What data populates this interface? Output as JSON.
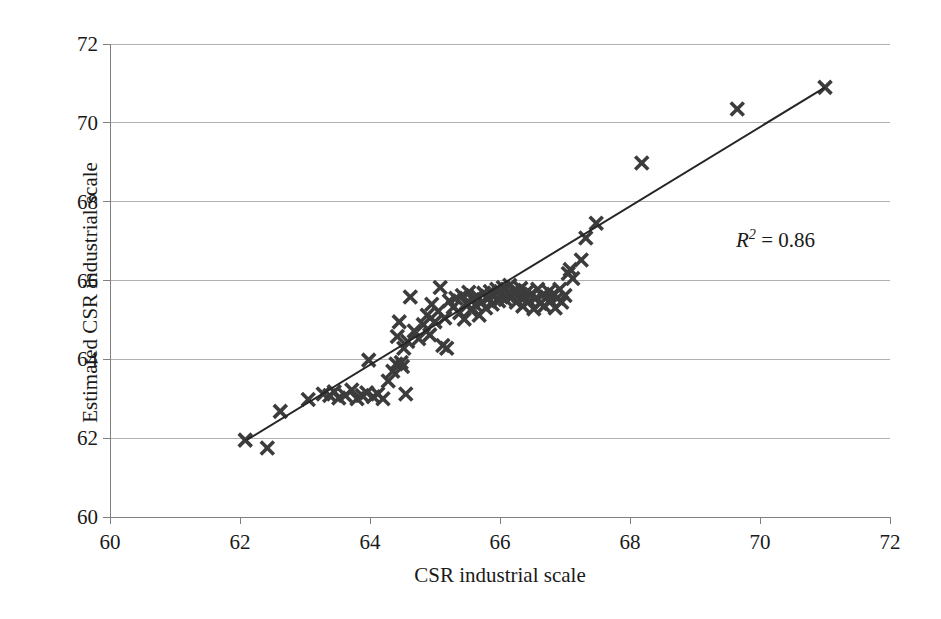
{
  "chart_data": {
    "type": "scatter",
    "title": "",
    "xlabel": "CSR industrial scale",
    "ylabel": "Estimated CSR industrial scale",
    "xlim": [
      60,
      72
    ],
    "ylim": [
      60,
      72
    ],
    "xticks": [
      60,
      62,
      64,
      66,
      68,
      70,
      72
    ],
    "yticks": [
      60,
      62,
      64,
      66,
      68,
      70,
      72
    ],
    "grid": "horizontal",
    "legend": "none",
    "annotations": [
      {
        "name": "r-squared",
        "text": "R2 = 0.86",
        "value": 0.86,
        "x": 70.6,
        "y": 67.3
      }
    ],
    "trendline": {
      "type": "linear",
      "x_start": 62.1,
      "y_start": 61.95,
      "x_end": 71.0,
      "y_end": 70.9,
      "color": "#262626"
    },
    "marker": {
      "shape": "x-bold",
      "color": "#3c3c3c",
      "size": 13
    },
    "points": [
      [
        62.08,
        61.95
      ],
      [
        62.42,
        61.75
      ],
      [
        62.62,
        62.68
      ],
      [
        63.05,
        62.98
      ],
      [
        63.28,
        63.12
      ],
      [
        63.38,
        63.08
      ],
      [
        63.45,
        63.18
      ],
      [
        63.52,
        63.02
      ],
      [
        63.62,
        63.08
      ],
      [
        63.72,
        63.22
      ],
      [
        63.8,
        63.0
      ],
      [
        63.88,
        63.08
      ],
      [
        63.95,
        63.15
      ],
      [
        63.98,
        63.98
      ],
      [
        64.05,
        63.05
      ],
      [
        64.12,
        63.12
      ],
      [
        64.2,
        63.0
      ],
      [
        64.28,
        63.45
      ],
      [
        64.35,
        63.7
      ],
      [
        64.4,
        63.88
      ],
      [
        64.42,
        64.58
      ],
      [
        64.45,
        64.95
      ],
      [
        64.48,
        63.92
      ],
      [
        64.5,
        63.82
      ],
      [
        64.52,
        64.28
      ],
      [
        64.55,
        63.12
      ],
      [
        64.58,
        64.45
      ],
      [
        64.62,
        65.58
      ],
      [
        64.68,
        64.72
      ],
      [
        64.75,
        64.52
      ],
      [
        64.82,
        64.88
      ],
      [
        64.88,
        65.12
      ],
      [
        64.92,
        64.62
      ],
      [
        64.95,
        65.4
      ],
      [
        65.0,
        64.95
      ],
      [
        65.05,
        65.22
      ],
      [
        65.08,
        65.82
      ],
      [
        65.12,
        64.35
      ],
      [
        65.15,
        65.05
      ],
      [
        65.18,
        64.28
      ],
      [
        65.22,
        65.48
      ],
      [
        65.28,
        65.32
      ],
      [
        65.32,
        65.55
      ],
      [
        65.38,
        65.18
      ],
      [
        65.42,
        65.62
      ],
      [
        65.45,
        65.02
      ],
      [
        65.48,
        65.42
      ],
      [
        65.52,
        65.7
      ],
      [
        65.55,
        65.25
      ],
      [
        65.58,
        65.52
      ],
      [
        65.62,
        65.38
      ],
      [
        65.65,
        65.6
      ],
      [
        65.68,
        65.12
      ],
      [
        65.72,
        65.45
      ],
      [
        65.75,
        65.68
      ],
      [
        65.78,
        65.3
      ],
      [
        65.82,
        65.55
      ],
      [
        65.85,
        65.72
      ],
      [
        65.88,
        65.4
      ],
      [
        65.92,
        65.62
      ],
      [
        65.95,
        65.78
      ],
      [
        65.98,
        65.48
      ],
      [
        66.02,
        65.66
      ],
      [
        66.05,
        65.82
      ],
      [
        66.08,
        65.52
      ],
      [
        66.12,
        65.7
      ],
      [
        66.15,
        65.88
      ],
      [
        66.18,
        65.58
      ],
      [
        66.22,
        65.75
      ],
      [
        66.25,
        65.45
      ],
      [
        66.28,
        65.62
      ],
      [
        66.32,
        65.8
      ],
      [
        66.35,
        65.35
      ],
      [
        66.38,
        65.58
      ],
      [
        66.42,
        65.72
      ],
      [
        66.45,
        65.48
      ],
      [
        66.48,
        65.65
      ],
      [
        66.52,
        65.28
      ],
      [
        66.55,
        65.55
      ],
      [
        66.58,
        65.78
      ],
      [
        66.62,
        65.42
      ],
      [
        66.65,
        65.62
      ],
      [
        66.68,
        65.35
      ],
      [
        66.72,
        65.58
      ],
      [
        66.75,
        65.72
      ],
      [
        66.78,
        65.48
      ],
      [
        66.82,
        65.65
      ],
      [
        66.85,
        65.3
      ],
      [
        66.88,
        65.55
      ],
      [
        66.92,
        65.78
      ],
      [
        66.95,
        65.45
      ],
      [
        67.0,
        65.62
      ],
      [
        67.05,
        66.18
      ],
      [
        67.08,
        66.28
      ],
      [
        67.12,
        66.05
      ],
      [
        67.25,
        66.52
      ],
      [
        67.32,
        67.08
      ],
      [
        67.48,
        67.45
      ],
      [
        68.18,
        68.98
      ],
      [
        69.65,
        70.35
      ],
      [
        71.0,
        70.9
      ]
    ]
  },
  "axes": {
    "y_tick_labels": [
      "72",
      "70",
      "68",
      "66",
      "64",
      "62",
      "60"
    ],
    "x_tick_labels": [
      "60",
      "62",
      "64",
      "66",
      "68",
      "70",
      "72"
    ],
    "y_title": "Estimated CSR industrial scale",
    "x_title": "CSR industrial scale"
  },
  "annotation": {
    "r_symbol": "R",
    "r_exponent": "2",
    "r_equals": " = 0.86"
  },
  "style": {
    "grid_color": "#b0b0b0",
    "axis_color": "#808080",
    "marker_color": "#3c3c3c",
    "line_color": "#262626",
    "text_color": "#1a1a1a",
    "background": "#ffffff"
  }
}
